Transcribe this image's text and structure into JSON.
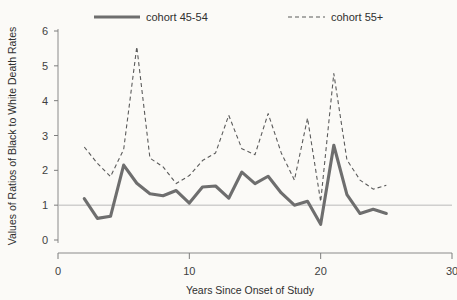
{
  "chart_data": {
    "type": "line",
    "title": "",
    "xlabel": "Years Since Onset of Study",
    "ylabel": "Values of Ratios of Black to White Death Rates",
    "xlim": [
      0,
      30
    ],
    "ylim": [
      0,
      6.3
    ],
    "xticks": [
      "0",
      "10",
      "20",
      "30"
    ],
    "xtick_values": [
      0,
      10,
      20,
      30
    ],
    "yticks": [
      "0",
      "1",
      "2",
      "3",
      "4",
      "5",
      "6"
    ],
    "ytick_values": [
      0,
      1,
      2,
      3,
      4,
      5,
      6
    ],
    "grid": false,
    "legend_position": "top",
    "reference_line": {
      "y": 1,
      "label": ""
    },
    "series": [
      {
        "name": "cohort 45-54",
        "style": "solid",
        "color": "#6e6e6e",
        "x": [
          2,
          3,
          4,
          5,
          6,
          7,
          8,
          9,
          10,
          11,
          12,
          13,
          14,
          15,
          16,
          17,
          18,
          19,
          20,
          21,
          22,
          23,
          24,
          25
        ],
        "values": [
          1.19,
          0.62,
          0.68,
          2.15,
          1.63,
          1.33,
          1.27,
          1.42,
          1.06,
          1.52,
          1.55,
          1.2,
          1.95,
          1.62,
          1.83,
          1.35,
          1.0,
          1.11,
          0.45,
          2.72,
          1.3,
          0.76,
          0.88,
          0.76
        ]
      },
      {
        "name": "cohort 55+",
        "style": "dashed",
        "color": "#5b5b5b",
        "x": [
          2,
          3,
          4,
          5,
          6,
          7,
          8,
          9,
          10,
          11,
          12,
          13,
          14,
          15,
          16,
          17,
          18,
          19,
          20,
          21,
          22,
          23,
          24,
          25
        ],
        "values": [
          2.67,
          2.2,
          1.82,
          2.6,
          5.55,
          2.35,
          2.1,
          1.62,
          1.85,
          2.28,
          2.5,
          3.58,
          2.62,
          2.45,
          3.63,
          2.5,
          1.72,
          3.5,
          1.1,
          4.78,
          2.3,
          1.72,
          1.46,
          1.57
        ]
      }
    ]
  },
  "legend": {
    "items": [
      {
        "label": "cohort 45-54",
        "style": "solid"
      },
      {
        "label": "cohort 55+",
        "style": "dashed"
      }
    ]
  }
}
